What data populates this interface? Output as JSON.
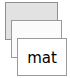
{
  "scene": {
    "kind": "card-stack",
    "background_color": "#ffffff",
    "card_count": 3
  },
  "cards": [
    {
      "id": "back",
      "label": "",
      "fill_color": "#e2e2e2",
      "border_color": "#8f8f8f",
      "depth": "back"
    },
    {
      "id": "middle",
      "label": "",
      "fill_color": "#fbfbfb",
      "border_color": "#9a9a9a",
      "depth": "middle"
    },
    {
      "id": "front",
      "label": "mat",
      "fill_color": "#ffffff",
      "border_color": "#9a9a9a",
      "text_color": "#000000",
      "depth": "front"
    }
  ]
}
